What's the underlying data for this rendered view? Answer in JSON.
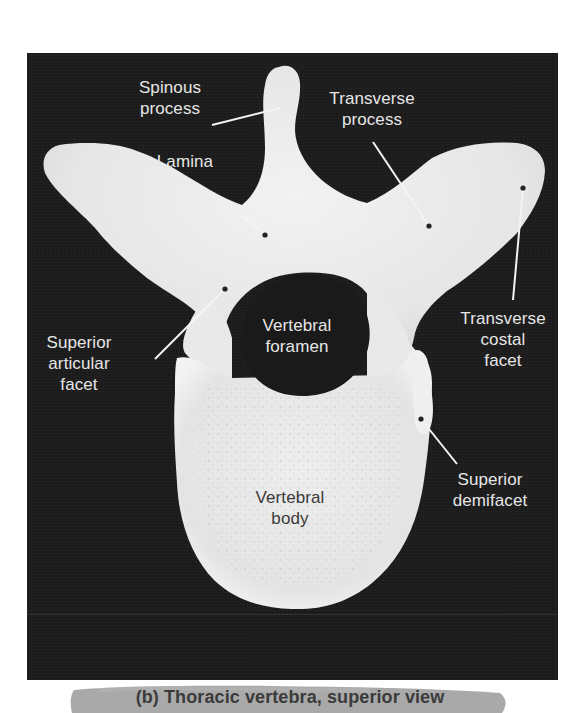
{
  "figure": {
    "panel_letter": "(b)",
    "caption": "(b) Thoracic vertebra, superior view",
    "subject": "Thoracic vertebra",
    "view": "superior view",
    "colors": {
      "background": "#1b1b1b",
      "bone": "#ebebeb",
      "label_text_light": "#e6e6e6",
      "label_text_dark": "#3a3a3a",
      "caption_banner": "#a9a9a9",
      "caption_text": "#3b3b3b"
    }
  },
  "labels": {
    "spinous_process": "Spinous\nprocess",
    "transverse_process": "Transverse\nprocess",
    "lamina": "Lamina",
    "superior_articular_facet": "Superior\narticular\nfacet",
    "vertebral_foramen": "Vertebral\nforamen",
    "transverse_costal_facet": "Transverse\ncostal\nfacet",
    "vertebral_body": "Vertebral\nbody",
    "superior_demifacet": "Superior\ndemifacet"
  }
}
